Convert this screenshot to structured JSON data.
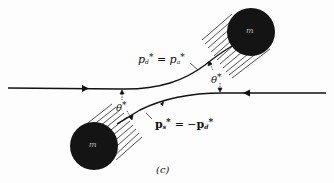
{
  "figure": {
    "caption": "(c)",
    "masses": [
      {
        "label": "m",
        "position": "upper-right"
      },
      {
        "label": "m",
        "position": "lower-left"
      }
    ],
    "angle_labels": [
      {
        "symbol": "θ",
        "star": "*",
        "position": "left"
      },
      {
        "symbol": "θ",
        "star": "*",
        "position": "right"
      }
    ],
    "equations": {
      "upper": {
        "lhs": "p",
        "lhs_sub": "d",
        "star": "*",
        "op": "=",
        "rhs": "p",
        "rhs_sub": "a",
        "rhs_star": "*"
      },
      "lower": {
        "lhs": "p",
        "lhs_sub": "s",
        "star": "*",
        "op": "= −",
        "rhs": "p",
        "rhs_sub": "d",
        "rhs_star": "*"
      }
    },
    "colors": {
      "ink": "#111111",
      "ball": "#141414",
      "background": "#fdfdfd"
    }
  }
}
